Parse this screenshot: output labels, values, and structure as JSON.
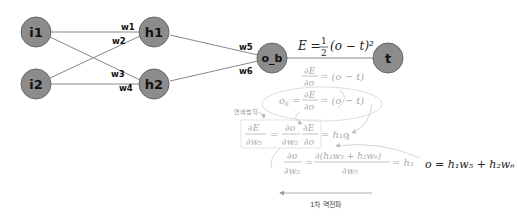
{
  "nodes": {
    "i1": "i1",
    "i2": "i2",
    "h1": "h1",
    "h2": "h2",
    "ob": "o_b",
    "t": "t"
  },
  "weights": {
    "w1": "w1",
    "w2": "w2",
    "w3": "w3",
    "w4": "w4",
    "w5": "w5",
    "w6": "w6"
  },
  "equations": {
    "error_lhs": "E =",
    "error_num": "1",
    "error_den": "2",
    "error_rhs": "(o − t)²",
    "dEdo_num": "∂E",
    "dEdo_den": "∂o",
    "dEdo_rhs": "= (o − t)",
    "delta_lhs": "o",
    "delta_sub": "δ",
    "delta_eq": "=",
    "delta_num": "∂E",
    "delta_den": "∂o",
    "delta_rhs": "= (o − t)",
    "chain_lhs_num": "∂E",
    "chain_lhs_den": "∂w₅",
    "chain_eq": "=",
    "chain_f1_num": "∂o",
    "chain_f1_den": "∂w₅",
    "chain_f2_num": "∂E",
    "chain_f2_den": "∂o",
    "chain_rhs": "= h₁o",
    "chain_rhs_sub": "δ",
    "do_num": "∂o",
    "do_den": "∂w₅",
    "do_eq": "=",
    "do_num2": "∂(h₁w₅ + h₂w₆)",
    "do_den2": "∂w₅",
    "do_rhs": "= h₁",
    "output_eq": "o = h₁w₅ + h₂w₆"
  },
  "annotations": {
    "chain_rule": "연쇄법칙",
    "backprop": "1차 역전파"
  }
}
